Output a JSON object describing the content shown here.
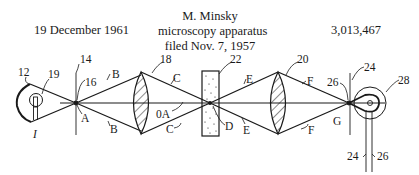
{
  "header": {
    "date": "19 December 1961",
    "title_lines": [
      "M. Minsky",
      "microscopy apparatus",
      "filed Nov. 7, 1957"
    ],
    "patent_number": "3,013,467"
  },
  "diagram": {
    "labels": {
      "l12": "12",
      "l19": "19",
      "lI": "I",
      "l14": "14",
      "l16": "16",
      "lA": "A",
      "lB1": "B",
      "lB2": "B",
      "l18": "18",
      "lC1": "C",
      "lC2": "C",
      "l0A": "0A",
      "l22": "22",
      "lD": "D",
      "lE1": "E",
      "lE2": "E",
      "l20": "20",
      "lF1": "F",
      "lF2": "F",
      "l26a": "26",
      "lG": "G",
      "l24a": "24",
      "l28": "28",
      "l24b": "24",
      "l26b": "26"
    }
  }
}
